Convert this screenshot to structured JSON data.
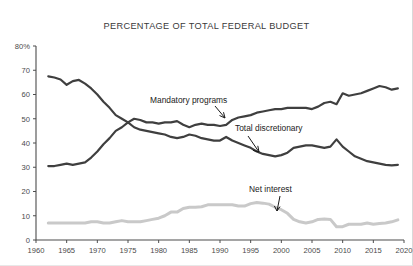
{
  "chart_data": {
    "type": "line",
    "title": "PERCENTAGE OF TOTAL FEDERAL BUDGET",
    "xlabel": "",
    "ylabel": "",
    "xlim": [
      1960,
      2020
    ],
    "ylim": [
      0,
      80
    ],
    "grid": false,
    "legend_position": "inline-annotations",
    "x_ticks": [
      "1960",
      "1965",
      "1970",
      "1975",
      "1980",
      "1985",
      "1990",
      "1995",
      "2000",
      "2005",
      "2010",
      "2015",
      "2020"
    ],
    "y_ticks": [
      "0",
      "10",
      "20",
      "30",
      "40",
      "50",
      "60",
      "70",
      "80%"
    ],
    "x": [
      1962,
      1963,
      1964,
      1965,
      1966,
      1967,
      1968,
      1969,
      1970,
      1971,
      1972,
      1973,
      1974,
      1975,
      1976,
      1977,
      1978,
      1979,
      1980,
      1981,
      1982,
      1983,
      1984,
      1985,
      1986,
      1987,
      1988,
      1989,
      1990,
      1991,
      1992,
      1993,
      1994,
      1995,
      1996,
      1997,
      1998,
      1999,
      2000,
      2001,
      2002,
      2003,
      2004,
      2005,
      2006,
      2007,
      2008,
      2009,
      2010,
      2011,
      2012,
      2013,
      2014,
      2015,
      2016,
      2017,
      2018,
      2019
    ],
    "series": [
      {
        "name": "Total discretionary",
        "color": "#3f3f3f",
        "annotation": "Total discretionary",
        "values": [
          67.5,
          67.0,
          66.2,
          64.0,
          65.5,
          66.0,
          64.5,
          62.5,
          60.0,
          57.0,
          54.5,
          51.5,
          50.0,
          48.5,
          46.5,
          45.5,
          45.0,
          44.5,
          44.0,
          43.5,
          42.5,
          42.0,
          42.5,
          43.5,
          43.0,
          42.0,
          41.5,
          41.0,
          41.0,
          42.5,
          41.0,
          40.0,
          39.0,
          38.0,
          36.5,
          35.5,
          35.0,
          34.5,
          35.0,
          36.0,
          38.0,
          38.5,
          39.0,
          39.0,
          38.5,
          38.0,
          38.5,
          41.5,
          38.5,
          36.5,
          34.5,
          33.5,
          32.5,
          32.0,
          31.5,
          31.0,
          30.8,
          31.0
        ]
      },
      {
        "name": "Mandatory programs",
        "color": "#3f3f3f",
        "annotation": "Mandatory programs",
        "values": [
          30.5,
          30.5,
          31.0,
          31.5,
          31.0,
          31.5,
          32.0,
          34.0,
          36.5,
          39.5,
          42.0,
          45.0,
          46.5,
          48.5,
          50.0,
          49.5,
          48.5,
          48.5,
          48.0,
          48.5,
          48.5,
          49.0,
          47.5,
          46.5,
          47.5,
          48.0,
          47.5,
          47.5,
          47.0,
          47.5,
          49.5,
          50.5,
          51.0,
          51.5,
          52.5,
          53.0,
          53.5,
          54.0,
          54.0,
          54.5,
          54.5,
          54.5,
          54.5,
          54.0,
          55.0,
          56.5,
          57.0,
          56.0,
          60.5,
          59.5,
          60.0,
          60.5,
          61.5,
          62.5,
          63.5,
          63.0,
          62.0,
          62.5
        ]
      },
      {
        "name": "Net interest",
        "color": "#c9c9c9",
        "annotation": "Net interest",
        "values": [
          7.0,
          7.0,
          7.0,
          7.0,
          7.0,
          7.0,
          7.0,
          7.5,
          7.5,
          7.0,
          7.0,
          7.5,
          8.0,
          7.5,
          7.5,
          7.5,
          8.0,
          8.5,
          9.0,
          10.0,
          11.5,
          11.5,
          13.0,
          13.5,
          13.5,
          13.7,
          14.5,
          14.5,
          14.5,
          14.5,
          14.5,
          14.0,
          14.0,
          15.0,
          15.5,
          15.2,
          14.8,
          13.5,
          12.5,
          11.0,
          8.5,
          7.5,
          7.0,
          7.5,
          8.5,
          8.7,
          8.5,
          5.5,
          5.5,
          6.5,
          6.5,
          6.5,
          7.0,
          6.5,
          6.8,
          7.0,
          7.5,
          8.3
        ]
      }
    ]
  }
}
